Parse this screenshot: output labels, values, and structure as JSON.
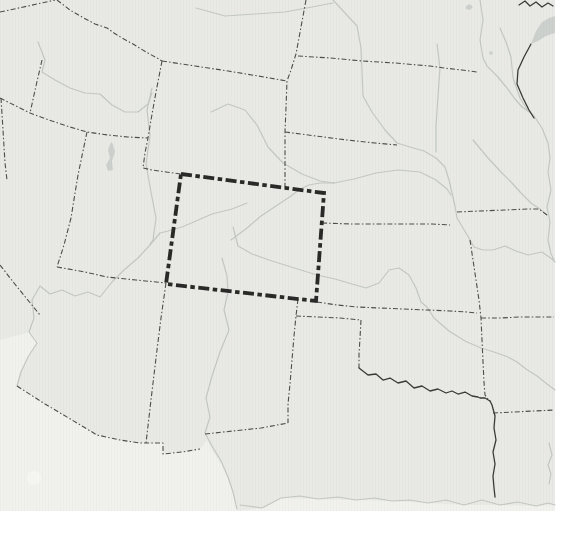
{
  "map": {
    "canvas": {
      "width": 563,
      "height": 538,
      "map_width": 555,
      "map_height": 511
    },
    "colors": {
      "page_bg": "#ffffff",
      "land": "#e9eae6",
      "lowland_mexico": "#f1f1ee",
      "river": "#c4c8c2",
      "border": "#4e4e4c",
      "dark_feature": "#3a3a38",
      "lake": "#cdd1cd",
      "highlight": "#2a2a28",
      "blob": "#f6f6f3"
    },
    "highlight_box": {
      "name": "colorado-highlight-outline",
      "points": "181,174 324,193 316,301 166,284",
      "stroke_width": 3.8,
      "dash": "11 3.5 4.5 3.5"
    },
    "regions": [
      {
        "name": "land-area",
        "points": "0,0 555,0 555,511 0,511",
        "fill": "land"
      },
      {
        "name": "mexico-lowland-area",
        "points": "0,340 30,332 38,342 28,358 20,372 17,386 45,404 72,420 97,435 120,440 140,443 163,443 163,454 182,452 200,449 207,440 213,452 223,466 230,484 237,503 238,511 0,511",
        "fill": "lowland_mexico"
      },
      {
        "name": "gulf-coast-lowland",
        "points": "238,511 262,508 281,498 318,499 356,500 392,501 428,503 464,505 500,505 536,506 555,505 555,511",
        "fill": "lowland_mexico"
      }
    ],
    "lakes": [
      {
        "name": "great-salt-lake",
        "points": "111,142 108,150 110,158 106,165 108,171 113,170 112,161 115,152 113,144"
      },
      {
        "name": "lake-superior-tip",
        "points": "531,44 536,31 542,22 549,18 555,16 555,33 546,36 538,41"
      },
      {
        "name": "small-lake-north",
        "points": "466,6 470,4 473,7 470,10 466,9"
      },
      {
        "name": "small-lake-minnesota",
        "points": "489,52 492,51 493,54 490,55"
      }
    ],
    "rivers": [
      {
        "name": "snake-river",
        "points": "38,42 45,60 42,72 55,80 70,88 85,93 100,94 112,105 125,112 138,112 148,104 152,93"
      },
      {
        "name": "yellowstone-river",
        "points": "196,8 225,16 255,14 285,12 312,7 333,3"
      },
      {
        "name": "missouri-river",
        "points": "333,0 345,13 357,26 361,48 362,72 363,96 372,112 385,130 397,143 410,147 424,151 436,158 445,167 449,180 452,193 455,206 457,218 463,228 469,238 474,247 483,250 493,250 505,246 516,251 528,255 542,252 552,259 555,262"
      },
      {
        "name": "james-river",
        "points": "437,44 440,68 438,96 436,126 436,152"
      },
      {
        "name": "red-river-north-minnesota-river",
        "points": "480,0 483,20 480,40 483,58 487,66 497,76 507,88 515,99 522,107 532,114"
      },
      {
        "name": "mississippi-river-upper",
        "points": "500,28 506,42 511,57 513,78 520,98 527,109 534,116 542,128 548,143 550,158 548,172 551,190 547,207 550,222 548,240 551,254 554,260"
      },
      {
        "name": "des-moines-river",
        "points": "473,140 488,158 501,172 512,183 521,193 531,203 540,209 547,215"
      },
      {
        "name": "north-platte-river",
        "points": "211,112 228,104 245,110 257,125 268,147 283,163 302,174 320,181 334,183"
      },
      {
        "name": "south-platte-river",
        "points": "231,240 247,228 261,216 276,206 291,196 300,189 309,185 320,183 334,183"
      },
      {
        "name": "platte-river",
        "points": "334,183 354,179 376,173 398,170 420,172 436,180 447,189 451,195"
      },
      {
        "name": "green-river",
        "points": "152,88 147,110 150,136 146,164 151,192 156,218 153,240 150,244"
      },
      {
        "name": "colorado-river",
        "points": "247,203 232,209 212,214 196,221 182,227 168,231 160,233 150,245 138,258 124,270 112,282 100,297 88,292 75,296 62,290 50,294 40,286 32,300 34,318 29,332 37,343 28,357 21,372 17,386"
      },
      {
        "name": "rio-grande-river",
        "points": "222,258 227,276 228,292 224,310 229,330 220,352 212,376 206,398 210,417 205,433 212,446 221,461 228,477 233,492 237,509"
      },
      {
        "name": "arkansas-river",
        "points": "233,227 238,246 252,254 269,260 288,266 304,271 317,275 335,279 352,284 366,288 379,283 389,270 399,268 409,275 416,288 421,302 427,307 434,318 449,331 465,341 481,348 494,352 508,357 517,362 526,369 537,376 547,384 555,390"
      },
      {
        "name": "gulf-coastline",
        "points": "240,505 262,508 281,498 300,496 318,499 338,497 356,500 374,498 392,501 410,500 428,503 446,500 464,505 482,500 500,505 518,502 536,506 548,503 555,505"
      },
      {
        "name": "mississippi-river-lower",
        "points": "549,443 552,455 548,465 551,474 549,484"
      }
    ],
    "state_borders": [
      {
        "name": "border-washington-oregon",
        "points": "0,12 28,6 55,0"
      },
      {
        "name": "border-idaho-montana",
        "points": "57,0 70,10 82,17 95,24 107,28 114,33 122,38 133,44 146,52 157,58 162,61"
      },
      {
        "name": "border-montana-wyoming",
        "points": "162,61 195,66 228,71 258,76 287,81"
      },
      {
        "name": "border-montana-dakota-nebraska",
        "points": "306,0 301,27 296,54 291,70 287,81 286,108 285,132 285,160 285,189"
      },
      {
        "name": "border-northdakota-southdakota",
        "points": "298,56 330,58 362,61 395,63 430,66 444,68 462,70 477,72"
      },
      {
        "name": "border-southdakota-nebraska",
        "points": "285,132 316,136 347,140 375,143 397,145"
      },
      {
        "name": "border-wyoming-west",
        "points": "162,61 156,92 151,120 148,138 145,153 143,168 152,170 166,172 181,174"
      },
      {
        "name": "border-42n-idaho-nevada-utah",
        "points": "0,98 14,105 30,113 52,121 70,127 87,132 108,135 128,137 148,138"
      },
      {
        "name": "border-oregon-idaho",
        "points": "42,60 36,86 30,113"
      },
      {
        "name": "border-california-nevada-north",
        "points": "1,98 3,130 5,163 7,180"
      },
      {
        "name": "border-california-nevada-diagonal",
        "points": "0,265 14,283 27,299 40,315"
      },
      {
        "name": "border-nevada-utah",
        "points": "87,132 78,175 71,218 64,245 57,267"
      },
      {
        "name": "border-utah-arizona-37n",
        "points": "57,267 85,272 107,277 136,280 166,283"
      },
      {
        "name": "border-arizona-newmexico",
        "points": "166,283 161,318 156,358 151,400 146,443"
      },
      {
        "name": "border-usa-mexico",
        "points": "17,386 45,404 72,420 97,435 120,440 140,443 152,443 163,443 163,454 182,452 200,449"
      },
      {
        "name": "border-newmexico-texas-32n",
        "points": "205,434 233,431 261,428 288,423"
      },
      {
        "name": "border-newmexico-east",
        "points": "298,299 296,316 294,336 292,360 290,384 288,404 288,423"
      },
      {
        "name": "border-texas-north-36-5n",
        "points": "296,316 318,317 340,318 361,320"
      },
      {
        "name": "border-oklahoma-panhandle-100w",
        "points": "361,320 360,338 359,354 359,368"
      },
      {
        "name": "border-kansas-oklahoma-37n",
        "points": "317,302 337,305 357,307 380,308 403,309 427,310 450,311 467,312 477,313"
      },
      {
        "name": "border-kansas-missouri-oklahoma-arkansas",
        "points": "470,240 473,260 476,280 479,300 481,318 482,340 483,362 484,382 485,395 488,399"
      },
      {
        "name": "border-missouri-arkansas-36-5n",
        "points": "481,318 500,318 520,317 537,317 554,317"
      },
      {
        "name": "border-arkansas-louisiana-33n",
        "points": "493,413 514,412 534,411 554,410"
      },
      {
        "name": "border-nebraska-kansas-40n",
        "points": "322,223 352,224 382,224 412,224 432,224 450,225"
      },
      {
        "name": "border-iowa-missouri",
        "points": "457,212 480,211 505,210 528,209 539,209 547,215"
      }
    ],
    "dark_features": [
      {
        "name": "red-river-texas-oklahoma-border",
        "points": "359,368 368,375 376,374 383,380 390,378 398,383 406,381 414,388 422,386 430,391 438,389 446,393 452,391 458,394 465,392 472,396 478,397 480,398 485,398 490,401"
      },
      {
        "name": "texas-east-border",
        "points": "490,401 492,405 495,416 494,428 496,440 493,452 495,464 493,476 494,488 495,497"
      },
      {
        "name": "minnesota-wisconsin-border",
        "points": "531,44 524,57 518,70 517,84 523,98 529,110 534,118"
      },
      {
        "name": "canada-border-lakes-squiggle",
        "points": "519,5 525,1 530,6 536,2 542,7 548,3 553,6"
      }
    ],
    "blobs": [
      {
        "name": "mexico-faint-spot",
        "cx": 34,
        "cy": 478,
        "r": 7
      }
    ]
  }
}
